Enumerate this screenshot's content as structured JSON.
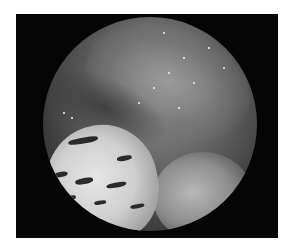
{
  "image": {
    "description": "Grayscale endoscopic view in a circular field on a black rectangular frame",
    "colors": {
      "background": "#ffffff",
      "frame": "#050505",
      "tissue_mid": "#6e6e6e",
      "highlight": "#f4f4f4"
    }
  }
}
